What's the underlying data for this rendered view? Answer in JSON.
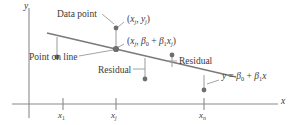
{
  "figure": {
    "type": "regression-residual-diagram",
    "axes": {
      "x_label": "x",
      "y_label": "y",
      "x_axis_y_px": 104,
      "y_axis_x_px": 29,
      "x_axis_from_px": 12,
      "x_axis_to_px": 278,
      "y_axis_from_px": 8,
      "y_axis_to_px": 118
    },
    "ticks": [
      {
        "name": "x-1",
        "label_main": "x",
        "label_sub": "1",
        "x_px": 63
      },
      {
        "name": "x-j",
        "label_main": "x",
        "label_sub": "j",
        "x_px": 116
      },
      {
        "name": "x-n",
        "label_main": "x",
        "label_sub": "n",
        "x_px": 204
      }
    ],
    "line": {
      "equation_label": {
        "y": "y",
        "equals": "=",
        "beta0": "β",
        "sub0": "0",
        "plus": "+",
        "beta1": "β",
        "sub1": "1",
        "x": "x"
      },
      "x1_px": 47,
      "y1_px": 33,
      "x2_px": 236,
      "y2_px": 77
    },
    "annotations": [
      {
        "name": "data-point-callout",
        "text": "Data point",
        "x_px": 57,
        "y_px": 10
      },
      {
        "name": "point-on-line-callout",
        "text": "Point on line",
        "x_px": 29,
        "y_px": 53
      },
      {
        "name": "residual-callout-left",
        "text": "Residual",
        "x_px": 98,
        "y_px": 66
      },
      {
        "name": "residual-callout-right",
        "text": "Residual",
        "x_px": 179,
        "y_px": 57
      }
    ],
    "point_labels": [
      {
        "name": "observed-point-label",
        "parts": [
          "(",
          "x",
          "j",
          ", ",
          "y",
          "j",
          ")"
        ],
        "x_px": 127,
        "y_px": 15
      },
      {
        "name": "fitted-point-label",
        "parts": [
          "(",
          "x",
          "j",
          ", ",
          "β",
          "0",
          " + ",
          "β",
          "1",
          "x",
          "j",
          ")"
        ],
        "x_px": 127,
        "y_px": 37
      }
    ],
    "points": [
      {
        "name": "data-point-1",
        "x_px": 57,
        "y_px": 57,
        "on_line": false
      },
      {
        "name": "fitted-point-j",
        "x_px": 116,
        "y_px": 49,
        "on_line": true
      },
      {
        "name": "data-point-j",
        "x_px": 116,
        "y_px": 28,
        "on_line": false
      },
      {
        "name": "data-point-3",
        "x_px": 145,
        "y_px": 79,
        "on_line": false
      },
      {
        "name": "data-point-4",
        "x_px": 172,
        "y_px": 55,
        "on_line": false
      },
      {
        "name": "data-point-n",
        "x_px": 204,
        "y_px": 90,
        "on_line": false
      }
    ],
    "residual_segments": [
      {
        "name": "residual-segment-1",
        "x_px": 57,
        "y_top_px": 37,
        "y_bottom_px": 57
      },
      {
        "name": "residual-segment-j",
        "x_px": 116,
        "y_top_px": 28,
        "y_bottom_px": 49
      },
      {
        "name": "residual-segment-3",
        "x_px": 145,
        "y_top_px": 58,
        "y_bottom_px": 79
      },
      {
        "name": "residual-segment-4",
        "x_px": 172,
        "y_top_px": 55,
        "y_bottom_px": 67
      },
      {
        "name": "residual-segment-n",
        "x_px": 204,
        "y_top_px": 75,
        "y_bottom_px": 90
      }
    ],
    "colors": {
      "ink": "#3a3a3a",
      "axis": "#8a8a8a",
      "line": "#7a7a7a",
      "point": "#6e6e6e",
      "leader": "#9a9a9a",
      "background": "#ffffff"
    }
  }
}
